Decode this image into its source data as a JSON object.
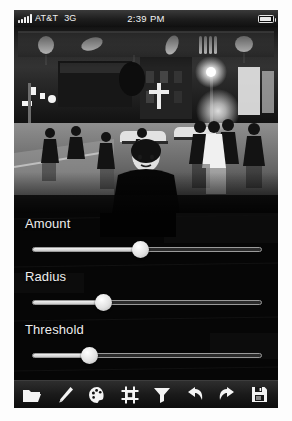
{
  "device": {
    "status_bar": {
      "signal_icon": "signal-bars-icon",
      "carrier": "AT&T",
      "network": "3G",
      "time": "2:39 PM",
      "battery_icon": "battery-icon"
    }
  },
  "photo": {
    "name": "edited-photo",
    "description": "Black and white night street scene with pedestrians and a central figure",
    "palette": {
      "black": "#070707",
      "dark": "#1d1d1d",
      "mid": "#6d6d6d",
      "light": "#d8d8d8",
      "white": "#ffffff"
    }
  },
  "panel": {
    "title": "Unsharp Mask",
    "controls": [
      {
        "label": "Amount",
        "value": 47,
        "min": 0,
        "max": 100
      },
      {
        "label": "Radius",
        "value": 31,
        "min": 0,
        "max": 100
      },
      {
        "label": "Threshold",
        "value": 25,
        "min": 0,
        "max": 100
      }
    ]
  },
  "toolbar": {
    "items": [
      {
        "icon": "folder-icon",
        "label": "Open"
      },
      {
        "icon": "brush-icon",
        "label": "Brush"
      },
      {
        "icon": "palette-icon",
        "label": "Adjust Color"
      },
      {
        "icon": "crop-icon",
        "label": "Crop"
      },
      {
        "icon": "funnel-icon",
        "label": "Filters"
      },
      {
        "icon": "undo-icon",
        "label": "Undo"
      },
      {
        "icon": "redo-icon",
        "label": "Redo"
      },
      {
        "icon": "save-icon",
        "label": "Save"
      }
    ]
  }
}
